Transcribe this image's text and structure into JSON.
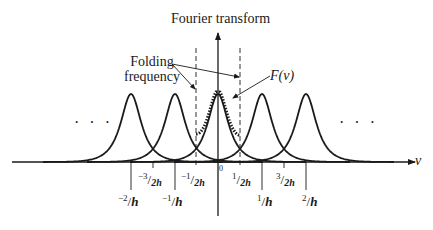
{
  "title": "Fourier transform",
  "annotations": {
    "folding_frequency": [
      "Folding",
      "frequency"
    ],
    "transform_label": "F(ν)",
    "axis_label": "ν",
    "origin": "0",
    "ellipsis_left": "· · ·",
    "ellipsis_right": "· · ·"
  },
  "ticks": [
    {
      "id": "m2h",
      "num": "−2",
      "den": "h",
      "value": -1.0
    },
    {
      "id": "m32h",
      "num": "−3",
      "den": "2h",
      "value": -0.75
    },
    {
      "id": "m1h",
      "num": "−1",
      "den": "h",
      "value": -0.5
    },
    {
      "id": "m12h",
      "num": "−1",
      "den": "2h",
      "value": -0.25
    },
    {
      "id": "p12h",
      "num": "1",
      "den": "2h",
      "value": 0.25
    },
    {
      "id": "p1h",
      "num": "1",
      "den": "h",
      "value": 0.5
    },
    {
      "id": "p32h",
      "num": "3",
      "den": "2h",
      "value": 0.75
    },
    {
      "id": "p2h",
      "num": "2",
      "den": "h",
      "value": 1.0
    }
  ],
  "peaks_centers": [
    "-2/h",
    "-1/h",
    "0",
    "1/h",
    "2/h"
  ],
  "colors": {
    "ink": "#1a1a1a",
    "background": "#ffffff"
  }
}
